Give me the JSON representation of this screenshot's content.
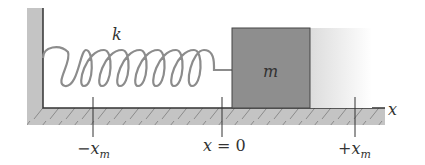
{
  "diagram": {
    "spring_label": "k",
    "mass_label": "m",
    "axis_label": "x",
    "ticks": [
      {
        "id": "neg",
        "sign": "−",
        "var": "x",
        "sub": "m",
        "x": 93
      },
      {
        "id": "zero",
        "text": "x = 0",
        "x": 222
      },
      {
        "id": "pos",
        "sign": "+",
        "var": "x",
        "sub": "m",
        "x": 355
      }
    ],
    "colors": {
      "wall": "#c4c4c4",
      "floor": "#c4c4c4",
      "hatch": "#8a8a8a",
      "line": "#333333",
      "spring": "#8c8c8c",
      "block": "#8e8e8e",
      "block_border": "#444444",
      "ghost": "#e6e6e6"
    }
  }
}
